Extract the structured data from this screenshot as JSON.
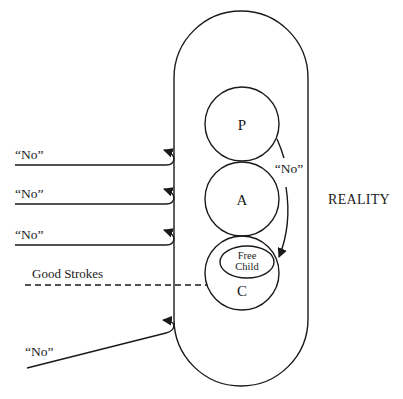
{
  "diagram": {
    "container_label": "REALITY",
    "ego_states": [
      {
        "id": "parent",
        "label": "P"
      },
      {
        "id": "adult",
        "label": "A"
      },
      {
        "id": "child",
        "label": "C"
      }
    ],
    "free_child": {
      "line1": "Free",
      "line2": "Child"
    },
    "inner_arrow_label": "“No”",
    "external_messages": [
      {
        "label": "“No”"
      },
      {
        "label": "“No”"
      },
      {
        "label": "“No”"
      },
      {
        "label": "“No”"
      }
    ],
    "good_strokes_label": "Good Strokes",
    "colors": {
      "ink": "#1a1a1a",
      "background": "#ffffff"
    }
  }
}
